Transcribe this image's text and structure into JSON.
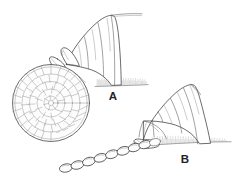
{
  "figure": {
    "background_color": "#ffffff",
    "ink_color": "#3b3b3d",
    "style": "scientific pen-and-ink line drawing",
    "width": 242,
    "height": 184
  },
  "panels": [
    {
      "id": "A",
      "label": "A",
      "label_x": 113,
      "label_y": 100,
      "description": "Insect abdomen with ovipositor depositing a flat spiral disc-shaped egg mass on a hairy substrate",
      "egg_mass_type": "spiral disc",
      "substrate": "hatched surface"
    },
    {
      "id": "B",
      "label": "B",
      "label_x": 185,
      "label_y": 163,
      "description": "Insect abdomen with ovipositor depositing a linear chain of oval eggs on a hairy substrate",
      "egg_mass_type": "linear chain",
      "substrate": "hatched surface"
    }
  ],
  "egg_disc": {
    "center_x": 51,
    "center_y": 103,
    "radius": 38,
    "ring_count": 5,
    "ring_radii": [
      6,
      13,
      20.5,
      28,
      35
    ],
    "cells_per_ring": [
      7,
      12,
      17,
      22,
      26
    ],
    "shape": "polygonal reticulate cells in concentric rings"
  },
  "egg_chain": {
    "egg_count": 9,
    "egg_shape": "oval",
    "start_x": 62,
    "start_y": 166,
    "end_x": 150,
    "end_y": 140,
    "egg_length": 12,
    "egg_width": 7
  },
  "abdomen_a": {
    "segment_count": 3,
    "tip_x": 66,
    "tip_y": 64,
    "base_x": 140,
    "base_y": 18
  },
  "abdomen_b": {
    "segment_count": 4,
    "tip_x": 143,
    "tip_y": 139,
    "base_x": 213,
    "base_y": 95
  },
  "substrate_a": {
    "line_y": 86,
    "x_start": 96,
    "x_end": 148,
    "bristle_count": 46
  },
  "substrate_b": {
    "line_y": 143,
    "x_start": 148,
    "x_end": 230,
    "bristle_count": 62
  }
}
